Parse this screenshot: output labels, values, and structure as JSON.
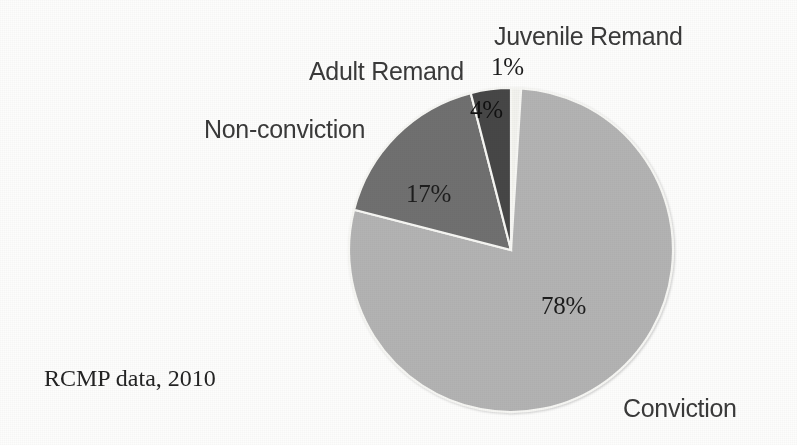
{
  "figure": {
    "source_note": "RCMP data, 2010",
    "background_color": "#fdfdfc"
  },
  "labels": {
    "juvenile_remand": "Juvenile Remand",
    "adult_remand": "Adult Remand",
    "non_conviction": "Non-conviction",
    "conviction": "Conviction"
  },
  "values": {
    "juvenile_remand": "1%",
    "adult_remand": "4%",
    "non_conviction": "17%",
    "conviction": "78%"
  },
  "chart_data": {
    "type": "pie",
    "title": "",
    "subtitle": "",
    "annotations": [
      "RCMP data, 2010"
    ],
    "legend_position": "none",
    "labels_position": "outside-callouts-and-inside-percentages",
    "start_angle_deg": 0,
    "direction": "clockwise",
    "categories": [
      "Juvenile Remand",
      "Conviction",
      "Non-conviction",
      "Adult Remand"
    ],
    "values": [
      1,
      78,
      17,
      4
    ],
    "value_labels": [
      "1%",
      "78%",
      "17%",
      "4%"
    ],
    "colors": [
      "#f2f2ee",
      "#b3b3b3",
      "#6f6f6f",
      "#474747"
    ],
    "slices": [
      {
        "label": "Juvenile Remand",
        "value": 1,
        "value_label": "1%",
        "color": "#f2f2ee"
      },
      {
        "label": "Conviction",
        "value": 78,
        "value_label": "78%",
        "color": "#b3b3b3"
      },
      {
        "label": "Non-conviction",
        "value": 17,
        "value_label": "17%",
        "color": "#6f6f6f"
      },
      {
        "label": "Adult Remand",
        "value": 4,
        "value_label": "4%",
        "color": "#474747"
      }
    ],
    "total": 100,
    "units": "percent"
  }
}
